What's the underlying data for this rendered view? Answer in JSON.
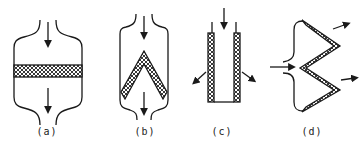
{
  "figure": {
    "panels": [
      {
        "id": "a",
        "label": "(a)",
        "type": "flat horizontal mesh across housing",
        "flow": "top-in, bottom-out"
      },
      {
        "id": "b",
        "label": "(b)",
        "type": "inverted-V mesh in housing",
        "flow": "top-in, bottom-out"
      },
      {
        "id": "c",
        "label": "(c)",
        "type": "cylindrical tube with mesh walls, closed bottom",
        "flow": "top-in, radial-out"
      },
      {
        "id": "d",
        "label": "(d)",
        "type": "zig-zag pleated mesh",
        "flow": "left-in, right-out"
      }
    ],
    "colors": {
      "line": "#1a1a1a",
      "background": "#ffffff"
    }
  }
}
